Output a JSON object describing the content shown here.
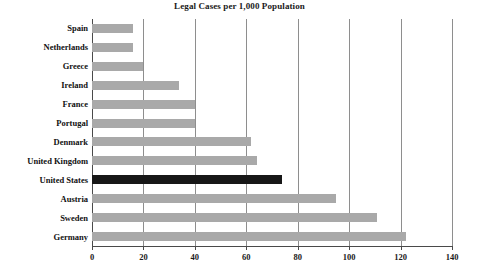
{
  "chart_data": {
    "type": "bar",
    "orientation": "horizontal",
    "title": "Legal Cases per 1,000 Population",
    "xlabel": "",
    "ylabel": "",
    "xlim": [
      0,
      140
    ],
    "xticks": [
      0,
      20,
      40,
      60,
      80,
      100,
      120,
      140
    ],
    "xtick_labels": [
      "0",
      "20",
      "40",
      "60",
      "80",
      "100",
      "120",
      "140"
    ],
    "grid": "vertical",
    "legend": null,
    "categories": [
      "Spain",
      "Netherlands",
      "Greece",
      "Ireland",
      "France",
      "Portugal",
      "Denmark",
      "United Kingdom",
      "United States",
      "Austria",
      "Sweden",
      "Germany"
    ],
    "values": [
      16,
      16,
      20,
      34,
      40,
      40,
      62,
      64,
      74,
      95,
      111,
      122
    ],
    "highlight_category": "United States",
    "colors": {
      "bar": "#a9a9a9",
      "highlight_bar": "#171717",
      "axis": "#4a4a4a",
      "gridline": "#8e8e8e",
      "text": "#111111",
      "background": "#ffffff"
    }
  }
}
